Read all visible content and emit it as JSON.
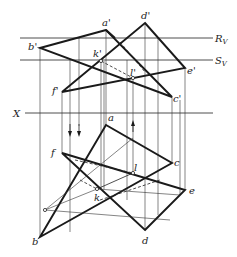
{
  "figure": {
    "type": "descriptive-geometry-projection",
    "labels": {
      "a_prime": "a'",
      "b_prime": "b'",
      "c_prime": "c'",
      "d_prime": "d'",
      "e_prime": "e'",
      "f_prime": "f'",
      "k_prime": "k'",
      "l_prime": "l'",
      "a": "a",
      "b": "b",
      "c": "c",
      "d": "d",
      "e": "e",
      "f": "f",
      "k": "k",
      "l": "l",
      "R_V": "R",
      "R_V_sub": "V",
      "S_V": "S",
      "S_V_sub": "V",
      "X": "X"
    },
    "colors": {
      "line": "#1a1a1a",
      "background": "#ffffff"
    },
    "front_view": {
      "triangle_abc": [
        [
          106,
          30
        ],
        [
          40,
          48
        ],
        [
          172,
          97
        ]
      ],
      "triangle_def": [
        [
          145,
          23
        ],
        [
          185,
          68
        ],
        [
          62,
          92
        ]
      ],
      "k_prime": [
        101,
        61
      ],
      "l_prime": [
        133,
        78
      ]
    },
    "top_view": {
      "triangle_abc": [
        [
          106,
          125
        ],
        [
          40,
          237
        ],
        [
          172,
          163
        ]
      ],
      "triangle_def": [
        [
          145,
          230
        ],
        [
          185,
          190
        ],
        [
          62,
          153
        ]
      ],
      "k": [
        97,
        189
      ],
      "l": [
        133,
        173
      ]
    },
    "reference_lines": {
      "R_V_y": 38,
      "S_V_y": 60,
      "X_y": 113
    }
  }
}
